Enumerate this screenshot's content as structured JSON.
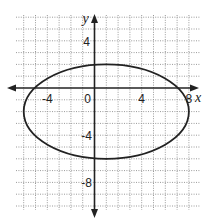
{
  "chart_data": {
    "type": "line",
    "title": "",
    "xlabel": "x",
    "ylabel": "y",
    "xlim": [
      -6.6,
      8.9
    ],
    "ylim": [
      -10.3,
      6.2
    ],
    "grid": true,
    "grid_step": 1,
    "x_tick_labels": [
      {
        "value": -4,
        "label": "-4"
      },
      {
        "value": 0,
        "label": "0"
      },
      {
        "value": 4,
        "label": "4"
      },
      {
        "value": 8,
        "label": "8"
      }
    ],
    "y_tick_labels": [
      {
        "value": 4,
        "label": "4"
      },
      {
        "value": -4,
        "label": "-4"
      },
      {
        "value": -8,
        "label": "-8"
      }
    ],
    "series": [
      {
        "name": "ellipse",
        "shape": "ellipse",
        "center": [
          1,
          -2
        ],
        "semi_axis_x": 7,
        "semi_axis_y": 4,
        "equation": "(x-1)^2/49 + (y+2)^2/16 = 1",
        "key_points": [
          [
            -6,
            -2
          ],
          [
            8,
            -2
          ],
          [
            1,
            2
          ],
          [
            1,
            -6
          ]
        ]
      }
    ],
    "legend": null
  },
  "layout": {
    "origin_px": [
      94.5,
      88
    ],
    "unit_px": 11.8,
    "grid_px": {
      "left": 16,
      "right": 200,
      "top": 15,
      "bottom": 210
    },
    "x_axis_px": {
      "from": 7,
      "to": 199
    },
    "y_axis_px": {
      "from": 14,
      "to": 218
    }
  },
  "colors": {
    "ink": "#222222",
    "grid": "#9a9a9a",
    "background": "#ffffff"
  }
}
